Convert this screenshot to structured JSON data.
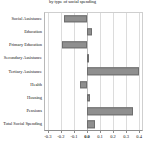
{
  "chart_data": {
    "type": "bar",
    "orientation": "horizontal",
    "title": "by type of social spending",
    "xlabel": "",
    "ylabel": "",
    "categories": [
      "Social Assistance",
      "Education",
      "Primary Education",
      "Secondary Assistance",
      "Tertiary Assistance",
      "Health",
      "Housing",
      "Pensions",
      "Total Social Spending"
    ],
    "values": [
      -0.18,
      0.035,
      -0.19,
      0.002,
      0.4,
      -0.05,
      0.025,
      0.355,
      0.065
    ],
    "xlim": [
      -0.33,
      0.43
    ],
    "xticks": [
      -0.3,
      -0.2,
      -0.1,
      0.0,
      0.1,
      0.2,
      0.3,
      0.4
    ],
    "xticklabels": [
      "-0.3",
      "-0.2",
      "-0.1",
      "0.0",
      "0.1",
      "0.2",
      "0.3",
      "0.4"
    ],
    "grid": true,
    "legend": null,
    "bar_color": "#8f8f8f",
    "bar_edge_color": "#6e6e6e",
    "zero_line_color": "#bdbdbd",
    "grid_color": "#dcdcdc"
  }
}
